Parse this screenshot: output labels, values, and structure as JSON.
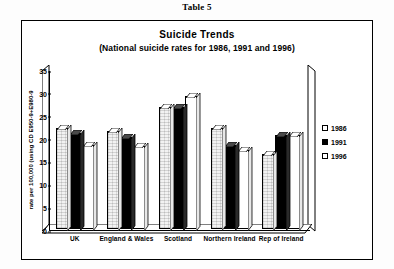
{
  "caption": "Table 5",
  "chart_data": {
    "type": "bar",
    "title": "Suicide Trends",
    "subtitle": "(National suicide rates for 1986, 1991 and 1996)",
    "xlabel": "",
    "ylabel": "rate per 100,000 (using CD E950-9+E980-9",
    "ylim": [
      0,
      35
    ],
    "yticks": [
      0,
      5,
      10,
      15,
      20,
      25,
      30,
      35
    ],
    "grid": false,
    "legend_position": "right",
    "categories": [
      "UK",
      "England & Wales",
      "Scotland",
      "Northern Ireland",
      "Rep of Ireland"
    ],
    "series": [
      {
        "name": "1986",
        "color": "#f2f2f2",
        "values": [
          23.2,
          22.5,
          28.0,
          23.0,
          17.2
        ]
      },
      {
        "name": "1991",
        "color": "#000000",
        "values": [
          22.0,
          21.0,
          28.0,
          19.2,
          21.5
        ]
      },
      {
        "name": "1996",
        "color": "#ffffff",
        "values": [
          19.2,
          19.0,
          30.5,
          18.0,
          21.5
        ]
      }
    ]
  },
  "legend": {
    "items": [
      {
        "label": "1986"
      },
      {
        "label": "1991"
      },
      {
        "label": "1996"
      }
    ]
  }
}
